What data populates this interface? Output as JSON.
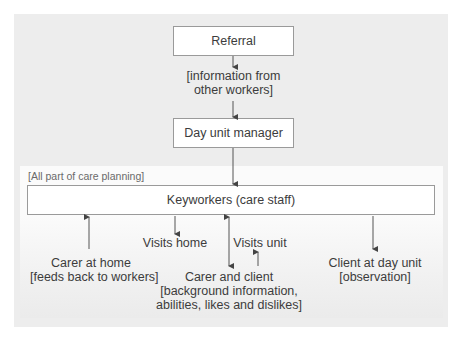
{
  "diagram": {
    "nodes": {
      "referral": "Referral",
      "info_from_workers_line1": "[information from",
      "info_from_workers_line2": "other workers]",
      "day_unit_manager": "Day unit manager",
      "care_planning_note": "[All part of care planning]",
      "keyworkers": "Keyworkers (care staff)",
      "carer_home_line1": "Carer at home",
      "carer_home_line2": "[feeds back to workers]",
      "visits_home": "Visits home",
      "visits_unit": "Visits unit",
      "carer_client_line1": "Carer and client",
      "carer_client_line2": "[background information,",
      "carer_client_line3": "abilities, likes and dislikes]",
      "client_unit_line1": "Client at day unit",
      "client_unit_line2": "[observation]"
    },
    "edges": [
      {
        "from": "Referral",
        "to": "[information from other workers]",
        "direction": "down"
      },
      {
        "from": "[information from other workers]",
        "to": "Day unit manager",
        "direction": "down"
      },
      {
        "from": "Day unit manager",
        "to": "Keyworkers (care staff)",
        "direction": "down"
      },
      {
        "from": "Carer at home",
        "to": "Keyworkers (care staff)",
        "direction": "up"
      },
      {
        "from": "Keyworkers (care staff)",
        "to": "Visits home",
        "direction": "down"
      },
      {
        "from": "Keyworkers (care staff)",
        "to": "Carer and client",
        "direction": "both"
      },
      {
        "from": "Carer and client",
        "to": "Visits unit",
        "direction": "up"
      },
      {
        "from": "Keyworkers (care staff)",
        "to": "Client at day unit",
        "direction": "down"
      }
    ],
    "colors": {
      "panel": "#ededed",
      "box_fill": "#ffffff",
      "box_border": "#9a9a9a",
      "arrow": "#444444",
      "text": "#3c3c3c"
    }
  }
}
